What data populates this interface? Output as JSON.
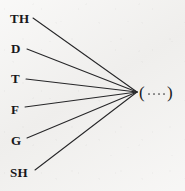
{
  "figure": {
    "type": "radial-convergence-diagram",
    "background_color": "#f2f1ef",
    "line_color": "#262628",
    "text_color": "#17171a",
    "width": 185,
    "height": 191
  },
  "source_nodes": [
    {
      "label": "TH",
      "x": 10,
      "y": 18,
      "line_start_x": 33,
      "line_start_y": 18
    },
    {
      "label": "D",
      "x": 11,
      "y": 48,
      "line_start_x": 27,
      "line_start_y": 49
    },
    {
      "label": "T",
      "x": 11,
      "y": 78,
      "line_start_x": 26,
      "line_start_y": 79
    },
    {
      "label": "F",
      "x": 11,
      "y": 109,
      "line_start_x": 25,
      "line_start_y": 107
    },
    {
      "label": "G",
      "x": 11,
      "y": 140,
      "line_start_x": 27,
      "line_start_y": 138
    },
    {
      "label": "SH",
      "x": 10,
      "y": 172,
      "line_start_x": 35,
      "line_start_y": 170
    }
  ],
  "target_node": {
    "open_paren": "(",
    "close_paren": ")",
    "dot_count": 4,
    "label_text": "( . . . . )",
    "x": 139,
    "y": 92
  },
  "convergence_point": {
    "x": 137,
    "y": 92
  },
  "edges": [
    {
      "from": "TH",
      "to": "target"
    },
    {
      "from": "D",
      "to": "target"
    },
    {
      "from": "T",
      "to": "target"
    },
    {
      "from": "F",
      "to": "target"
    },
    {
      "from": "G",
      "to": "target"
    },
    {
      "from": "SH",
      "to": "target"
    }
  ]
}
